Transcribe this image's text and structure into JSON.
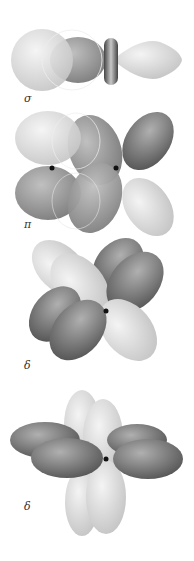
{
  "diagram": {
    "panels": [
      {
        "id": "sigma",
        "label": "σ"
      },
      {
        "id": "pi",
        "label": "π"
      },
      {
        "id": "delta1",
        "label": "δ"
      },
      {
        "id": "delta2",
        "label": "δ"
      }
    ]
  },
  "colors": {
    "light_lobe": "#d6d6d6",
    "mid_lobe": "#9a9a9a",
    "dark_lobe": "#6e6e6e",
    "nucleus": "#111111"
  }
}
